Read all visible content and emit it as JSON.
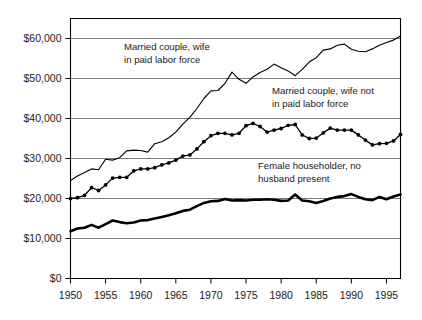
{
  "chart_data": {
    "type": "line",
    "title": "",
    "subtitle": "",
    "xlabel": "",
    "ylabel": "",
    "xlim": [
      1950,
      1997
    ],
    "ylim": [
      0,
      65000
    ],
    "grid": true,
    "legend_position": "inline-annotations",
    "x_tick_labels": [
      "1950",
      "1955",
      "1960",
      "1965",
      "1970",
      "1975",
      "1980",
      "1985",
      "1990",
      "1995"
    ],
    "x_ticks": [
      1950,
      1955,
      1960,
      1965,
      1970,
      1975,
      1980,
      1985,
      1990,
      1995
    ],
    "y_tick_labels": [
      "$0",
      "$10,000",
      "$20,000",
      "$30,000",
      "$40,000",
      "$50,000",
      "$60,000"
    ],
    "y_ticks": [
      0,
      10000,
      20000,
      30000,
      40000,
      50000,
      60000
    ],
    "x": [
      1950,
      1951,
      1952,
      1953,
      1954,
      1955,
      1956,
      1957,
      1958,
      1959,
      1960,
      1961,
      1962,
      1963,
      1964,
      1965,
      1966,
      1967,
      1968,
      1969,
      1970,
      1971,
      1972,
      1973,
      1974,
      1975,
      1976,
      1977,
      1978,
      1979,
      1980,
      1981,
      1982,
      1983,
      1984,
      1985,
      1986,
      1987,
      1988,
      1989,
      1990,
      1991,
      1992,
      1993,
      1994,
      1995,
      1996,
      1997
    ],
    "series": [
      {
        "name": "Married couple, wife in paid labor force",
        "marker": "none",
        "line_weight": "thin",
        "annotation": "Married couple, wife\nin paid labor force",
        "values": [
          24500,
          25600,
          26500,
          27400,
          27200,
          29800,
          29600,
          30200,
          31900,
          32100,
          32000,
          31600,
          33700,
          34200,
          35200,
          36600,
          38600,
          40300,
          42500,
          45000,
          46900,
          47000,
          48800,
          51600,
          49800,
          48800,
          50400,
          51500,
          52300,
          53600,
          52700,
          51900,
          50700,
          52300,
          54100,
          55200,
          57100,
          57400,
          58300,
          58600,
          57300,
          56800,
          56700,
          57400,
          58300,
          59000,
          59600,
          60600
        ]
      },
      {
        "name": "Married couple, wife not in paid labor force",
        "marker": "dot",
        "line_weight": "medium",
        "annotation": "Married couple, wife not\nin paid labor force",
        "values": [
          20000,
          20200,
          20800,
          22700,
          22000,
          23400,
          25100,
          25300,
          25300,
          26900,
          27400,
          27400,
          27700,
          28400,
          28900,
          29600,
          30600,
          30900,
          32400,
          34200,
          35700,
          36300,
          36300,
          35900,
          36300,
          38200,
          38800,
          38000,
          36600,
          37100,
          37500,
          38300,
          38500,
          35900,
          35000,
          35100,
          36400,
          37600,
          37100,
          37100,
          37100,
          35900,
          34600,
          33400,
          33700,
          33800,
          34400,
          36000
        ]
      },
      {
        "name": "Female householder, no husband present",
        "marker": "none",
        "line_weight": "thick",
        "annotation": "Female householder, no\nhusband present",
        "values": [
          11800,
          12500,
          12700,
          13400,
          12700,
          13600,
          14500,
          14100,
          13800,
          14000,
          14500,
          14600,
          15000,
          15400,
          15800,
          16300,
          16900,
          17200,
          18100,
          18900,
          19300,
          19400,
          19900,
          19500,
          19600,
          19500,
          19700,
          19700,
          19800,
          19700,
          19400,
          19500,
          21000,
          19500,
          19300,
          18900,
          19400,
          20000,
          20400,
          20600,
          21100,
          20400,
          19800,
          19600,
          20400,
          19800,
          20500,
          21000
        ]
      }
    ]
  },
  "annotations": {
    "married_wife_working": {
      "line1": "Married couple, wife",
      "line2": "in paid labor force"
    },
    "married_wife_not_working": {
      "line1": "Married couple, wife not",
      "line2": "in paid labor force"
    },
    "female_householder": {
      "line1": "Female householder, no",
      "line2": "husband present"
    }
  },
  "colors": {
    "line": "#000000",
    "grid": "#4d4d4d",
    "frame": "#000000",
    "text": "#1a1a1a",
    "background": "#ffffff"
  }
}
